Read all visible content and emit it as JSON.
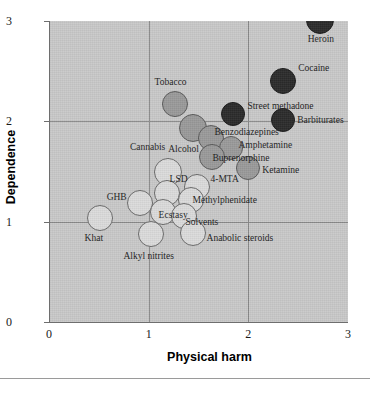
{
  "chart_data": {
    "type": "scatter",
    "title": "",
    "xlabel": "Physical harm",
    "ylabel": "Dependence",
    "xlim": [
      0,
      3
    ],
    "ylim": [
      0,
      3
    ],
    "xticks": [
      "0",
      "1",
      "2",
      "3"
    ],
    "yticks": [
      "0",
      "1",
      "2",
      "3"
    ],
    "grid": true,
    "legend": "none",
    "colors": {
      "light": "#dcdcdc",
      "medium": "#9a9a9a",
      "dark": "#2b2b2b",
      "panel": "#c9c9c9",
      "gridline": "#8a8a8a",
      "text": "#1d1d1d"
    },
    "points": [
      {
        "label": "Heroin",
        "x": 2.72,
        "y": 3.01,
        "r": 14,
        "shade": "dark",
        "label_pos": "end",
        "label_dx": 14,
        "label_dy": 20
      },
      {
        "label": "Cocaine",
        "x": 2.35,
        "y": 2.4,
        "r": 13,
        "shade": "dark",
        "label_pos": "start",
        "label_dx": 15,
        "label_dy": -12
      },
      {
        "label": "Street methadone",
        "x": 1.85,
        "y": 2.07,
        "r": 12,
        "shade": "dark",
        "label_pos": "start",
        "label_dx": 14,
        "label_dy": -7
      },
      {
        "label": "Barbiturates",
        "x": 2.35,
        "y": 2.01,
        "r": 12,
        "shade": "dark",
        "label_pos": "start",
        "label_dx": 14,
        "label_dy": 1
      },
      {
        "label": "Tobacco",
        "x": 1.26,
        "y": 2.17,
        "r": 13,
        "shade": "medium",
        "label_pos": "mid",
        "label_dx": -4,
        "label_dy": -21
      },
      {
        "label": "Alcohol",
        "x": 1.44,
        "y": 1.93,
        "r": 14,
        "shade": "medium",
        "label_pos": "mid",
        "label_dx": -9,
        "label_dy": 22
      },
      {
        "label": "Benzodiazepines",
        "x": 1.63,
        "y": 1.83,
        "r": 13,
        "shade": "medium",
        "label_pos": "start",
        "label_dx": 3,
        "label_dy": -5
      },
      {
        "label": "Amphetamine",
        "x": 1.83,
        "y": 1.73,
        "r": 12,
        "shade": "medium",
        "label_pos": "start",
        "label_dx": 7,
        "label_dy": -2
      },
      {
        "label": "Buprenorphine",
        "x": 1.64,
        "y": 1.64,
        "r": 13,
        "shade": "medium",
        "label_pos": "start",
        "label_dx": 0,
        "label_dy": 2
      },
      {
        "label": "Ketamine",
        "x": 2.0,
        "y": 1.53,
        "r": 12,
        "shade": "medium",
        "label_pos": "start",
        "label_dx": 14,
        "label_dy": 3
      },
      {
        "label": "Cannabis",
        "x": 1.19,
        "y": 1.5,
        "r": 14,
        "shade": "light",
        "label_pos": "mid",
        "label_dx": -20,
        "label_dy": -24
      },
      {
        "label": "LSD",
        "x": 1.18,
        "y": 1.29,
        "r": 13,
        "shade": "light",
        "label_pos": "start",
        "label_dx": 3,
        "label_dy": -13
      },
      {
        "label": "4-MTA",
        "x": 1.48,
        "y": 1.35,
        "r": 13,
        "shade": "light",
        "label_pos": "start",
        "label_dx": 14,
        "label_dy": -7
      },
      {
        "label": "GHB",
        "x": 0.91,
        "y": 1.19,
        "r": 13,
        "shade": "light",
        "label_pos": "end",
        "label_dx": -13,
        "label_dy": -5
      },
      {
        "label": "Methylphenidate",
        "x": 1.42,
        "y": 1.22,
        "r": 13,
        "shade": "light",
        "label_pos": "start",
        "label_dx": 2,
        "label_dy": 1
      },
      {
        "label": "Ecstasy",
        "x": 1.14,
        "y": 1.1,
        "r": 13,
        "shade": "light",
        "label_pos": "start",
        "label_dx": -4,
        "label_dy": 4
      },
      {
        "label": "Solvents",
        "x": 1.35,
        "y": 1.06,
        "r": 13,
        "shade": "light",
        "label_pos": "start",
        "label_dx": 2,
        "label_dy": 7
      },
      {
        "label": "Khat",
        "x": 0.51,
        "y": 1.04,
        "r": 13,
        "shade": "light",
        "label_pos": "mid",
        "label_dx": -6,
        "label_dy": 21
      },
      {
        "label": "Alkyl nitrites",
        "x": 1.02,
        "y": 0.88,
        "r": 13,
        "shade": "light",
        "label_pos": "mid",
        "label_dx": -2,
        "label_dy": 23
      },
      {
        "label": "Anabolic steroids",
        "x": 1.44,
        "y": 0.89,
        "r": 13,
        "shade": "light",
        "label_pos": "start",
        "label_dx": 14,
        "label_dy": 6
      }
    ]
  }
}
